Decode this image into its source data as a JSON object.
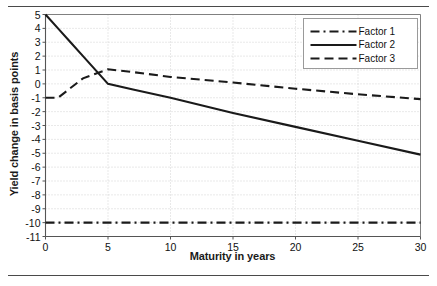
{
  "figure": {
    "top_rule": "horizontal-rule",
    "bottom_rule": "horizontal-rule"
  },
  "chart_data": {
    "type": "line",
    "title": "",
    "xlabel": "Maturity in years",
    "ylabel": "Yield change in basis points",
    "xlim": [
      0,
      30
    ],
    "ylim": [
      -11,
      5
    ],
    "xticks": [
      0,
      5,
      10,
      15,
      20,
      25,
      30
    ],
    "yticks": [
      5,
      4,
      3,
      2,
      1,
      0,
      -1,
      -2,
      -3,
      -4,
      -5,
      -6,
      -7,
      -8,
      -9,
      -10,
      -11
    ],
    "grid": true,
    "grid_style": "dotted",
    "legend_position": "top-right",
    "series": [
      {
        "name": "Factor 1",
        "style": "dash-dot",
        "color": "#1a1a1a",
        "x": [
          0,
          1,
          2,
          3,
          5,
          7,
          10,
          15,
          20,
          25,
          30
        ],
        "values": [
          -10,
          -10,
          -10,
          -10,
          -10,
          -10,
          -10,
          -10,
          -10,
          -10,
          -10
        ]
      },
      {
        "name": "Factor 2",
        "style": "solid",
        "color": "#1a1a1a",
        "x": [
          0,
          1,
          2,
          3,
          5,
          7,
          10,
          15,
          20,
          25,
          30
        ],
        "values": [
          5,
          4,
          3,
          2,
          0,
          -0.4,
          -1,
          -2.1,
          -3.1,
          -4.1,
          -5.1
        ]
      },
      {
        "name": "Factor 3",
        "style": "dashed",
        "color": "#1a1a1a",
        "x": [
          0,
          1,
          2,
          3,
          5,
          7,
          10,
          15,
          20,
          25,
          30
        ],
        "values": [
          -1,
          -1,
          -0.3,
          0.4,
          1.05,
          0.85,
          0.5,
          0.1,
          -0.35,
          -0.75,
          -1.1
        ]
      }
    ]
  },
  "axis_titles": {
    "y": "Yield change in basis points",
    "x": "Maturity in years"
  },
  "legend": {
    "entries": [
      "Factor 1",
      "Factor 2",
      "Factor 3"
    ]
  },
  "colors": {
    "line": "#1a1a1a",
    "grid": "#c8c8c8",
    "axis": "#808080",
    "rule": "#4a4a4a"
  }
}
